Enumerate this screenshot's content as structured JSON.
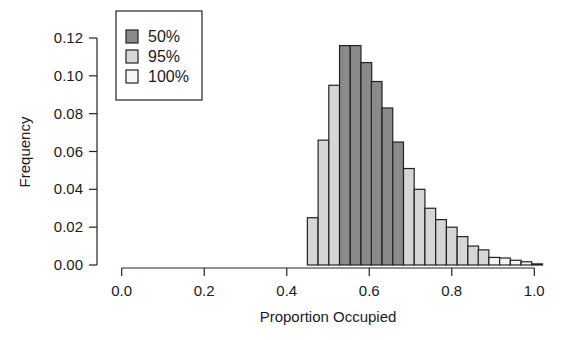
{
  "chart_data": {
    "type": "bar",
    "subtype": "histogram",
    "title": "",
    "xlabel": "Proportion Occupied",
    "ylabel": "Frequency",
    "xlim": [
      0.0,
      1.0
    ],
    "ylim": [
      0.0,
      0.12
    ],
    "x_ticks": [
      "0.0",
      "0.2",
      "0.4",
      "0.6",
      "0.8",
      "1.0"
    ],
    "x_tick_values": [
      0.0,
      0.2,
      0.4,
      0.6,
      0.8,
      1.0
    ],
    "y_ticks": [
      "0.00",
      "0.02",
      "0.04",
      "0.06",
      "0.08",
      "0.10",
      "0.12"
    ],
    "y_tick_values": [
      0.0,
      0.02,
      0.04,
      0.06,
      0.08,
      0.1,
      0.12
    ],
    "grid": false,
    "legend_position": "top-left",
    "legend": [
      {
        "label": "50%",
        "color": "#8a8a8a"
      },
      {
        "label": "95%",
        "color": "#d6d6d6"
      },
      {
        "label": "100%",
        "color": "#f5f5f5"
      }
    ],
    "bin_start": 0.45,
    "bin_width": 0.0259,
    "bins": [
      {
        "x": 0.45,
        "value": 0.025,
        "group": "95%"
      },
      {
        "x": 0.476,
        "value": 0.066,
        "group": "95%"
      },
      {
        "x": 0.502,
        "value": 0.095,
        "group": "95%"
      },
      {
        "x": 0.528,
        "value": 0.116,
        "group": "50%"
      },
      {
        "x": 0.554,
        "value": 0.116,
        "group": "50%"
      },
      {
        "x": 0.58,
        "value": 0.107,
        "group": "50%"
      },
      {
        "x": 0.605,
        "value": 0.097,
        "group": "50%"
      },
      {
        "x": 0.631,
        "value": 0.083,
        "group": "50%"
      },
      {
        "x": 0.657,
        "value": 0.065,
        "group": "50%"
      },
      {
        "x": 0.683,
        "value": 0.051,
        "group": "95%"
      },
      {
        "x": 0.709,
        "value": 0.04,
        "group": "95%"
      },
      {
        "x": 0.735,
        "value": 0.03,
        "group": "95%"
      },
      {
        "x": 0.761,
        "value": 0.024,
        "group": "95%"
      },
      {
        "x": 0.787,
        "value": 0.02,
        "group": "95%"
      },
      {
        "x": 0.813,
        "value": 0.015,
        "group": "95%"
      },
      {
        "x": 0.839,
        "value": 0.01,
        "group": "95%"
      },
      {
        "x": 0.864,
        "value": 0.008,
        "group": "95%"
      },
      {
        "x": 0.89,
        "value": 0.004,
        "group": "100%"
      },
      {
        "x": 0.916,
        "value": 0.0037,
        "group": "100%"
      },
      {
        "x": 0.942,
        "value": 0.0025,
        "group": "100%"
      },
      {
        "x": 0.968,
        "value": 0.0017,
        "group": "100%"
      },
      {
        "x": 0.994,
        "value": 0.0006,
        "group": "100%"
      }
    ]
  }
}
